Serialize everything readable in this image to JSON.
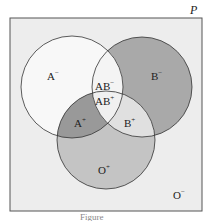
{
  "universe_label": "P",
  "regions": {
    "a_neg": {
      "base": "A",
      "sign": "−"
    },
    "b_neg": {
      "base": "B",
      "sign": "−"
    },
    "ab_neg": {
      "base": "AB",
      "sign": "−"
    },
    "ab_pos": {
      "base": "AB",
      "sign": "+"
    },
    "a_pos": {
      "base": "A",
      "sign": "+"
    },
    "b_pos": {
      "base": "B",
      "sign": "+"
    },
    "o_pos": {
      "base": "O",
      "sign": "+"
    },
    "o_neg": {
      "base": "O",
      "sign": "−"
    }
  },
  "caption": "Figure",
  "colors": {
    "background": "#ededed",
    "circle_a": "#f8f8f8",
    "circle_b": "#a8a8a8",
    "circle_o": "#c4c4c4",
    "stroke": "#333333"
  }
}
